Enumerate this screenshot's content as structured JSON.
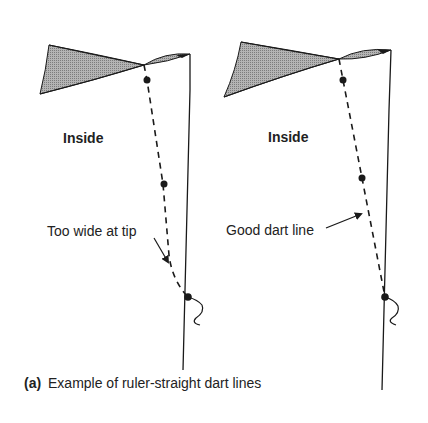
{
  "figure": {
    "caption_letter": "(a)",
    "caption_text": "Example of ruler-straight dart lines",
    "colors": {
      "line": "#1a1a1a",
      "shade": "#9a9a9a",
      "text": "#222222",
      "background": "#ffffff"
    }
  },
  "panels": [
    {
      "id": "left",
      "region_label": "Inside",
      "annotation": "Too wide at tip",
      "verdict": "bad"
    },
    {
      "id": "right",
      "region_label": "Inside",
      "annotation": "Good dart line",
      "verdict": "good"
    }
  ]
}
